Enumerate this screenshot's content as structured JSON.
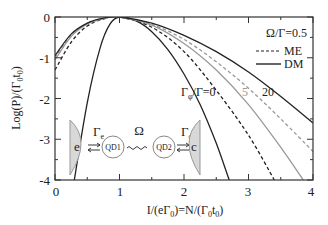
{
  "chart_data": {
    "type": "line",
    "title": "",
    "xlabel": "I/(eΓ0)=N/(Γ0t0)",
    "ylabel": "Log(P)/(Γ0t0)",
    "xlim": [
      0,
      4
    ],
    "ylim": [
      -4,
      0
    ],
    "xticks": [
      "0",
      "1",
      "2",
      "3",
      "4"
    ],
    "yticks": [
      "0",
      "-1",
      "-2",
      "-3",
      "-4"
    ],
    "grid": false,
    "legend": {
      "title": "Ω/Γ=0.5",
      "entries": [
        {
          "label": "ME",
          "style": "dashed"
        },
        {
          "label": "DM",
          "style": "solid"
        }
      ],
      "position": "upper right"
    },
    "annotations": [
      {
        "text": "Γφ/Γ=0",
        "x": 2.35,
        "y": -2.0
      },
      {
        "text": "5",
        "x": 3.08,
        "y": -2.0
      },
      {
        "text": "20",
        "x": 3.4,
        "y": -2.0
      }
    ],
    "inset_diagram": {
      "left_reservoir": "e",
      "left_rate": "Γe",
      "dot1": "QD1",
      "coupling": "Ω",
      "dot2": "QD2",
      "right_rate": "Γc",
      "right_reservoir": "c"
    },
    "series": [
      {
        "name": "DM Γφ/Γ=0",
        "style": "solid",
        "color": "#222222",
        "x": [
          0.3,
          0.5,
          0.7,
          0.85,
          1.0,
          1.25,
          1.5,
          1.75,
          2.0,
          2.25,
          2.5,
          2.7
        ],
        "y": [
          -4.0,
          -2.1,
          -0.75,
          -0.18,
          0.0,
          -0.09,
          -0.36,
          -0.8,
          -1.4,
          -2.15,
          -3.1,
          -4.0
        ]
      },
      {
        "name": "ME Γφ/Γ=0",
        "style": "dashed",
        "color": "#222222",
        "x": [
          0.0,
          0.25,
          0.5,
          0.75,
          1.0,
          1.5,
          2.0,
          2.5,
          3.0,
          3.4
        ],
        "y": [
          -1.3,
          -0.62,
          -0.22,
          -0.05,
          0.0,
          -0.25,
          -0.85,
          -1.8,
          -2.9,
          -4.0
        ]
      },
      {
        "name": "DM Γφ/Γ=5",
        "style": "solid",
        "color": "#999999",
        "x": [
          0.0,
          0.25,
          0.5,
          0.75,
          1.0,
          1.5,
          2.0,
          2.5,
          3.0,
          3.5,
          3.85
        ],
        "y": [
          -1.05,
          -0.48,
          -0.17,
          -0.04,
          0.0,
          -0.2,
          -0.65,
          -1.3,
          -2.15,
          -3.2,
          -4.0
        ]
      },
      {
        "name": "ME Γφ/Γ=5",
        "style": "dashed",
        "color": "#999999",
        "x": [
          0.0,
          0.25,
          0.5,
          0.75,
          1.0,
          1.5,
          2.0,
          2.5,
          3.0,
          3.5,
          4.0
        ],
        "y": [
          -1.0,
          -0.45,
          -0.16,
          -0.04,
          0.0,
          -0.18,
          -0.55,
          -1.1,
          -1.75,
          -2.5,
          -3.3
        ]
      },
      {
        "name": "DM Γφ/Γ=20",
        "style": "solid",
        "color": "#222222",
        "x": [
          0.0,
          0.25,
          0.5,
          0.75,
          1.0,
          1.5,
          2.0,
          2.5,
          3.0,
          3.5,
          4.0
        ],
        "y": [
          -0.95,
          -0.42,
          -0.15,
          -0.03,
          0.0,
          -0.15,
          -0.45,
          -0.85,
          -1.35,
          -1.95,
          -2.6
        ]
      }
    ]
  },
  "labels": {
    "ylabel_main": "Log(P)/(Γ",
    "xlabel_text": "I/(eΓ₀)=N/(Γ₀t₀)",
    "legend_title": "Ω/Γ=0.5",
    "legend_me": "ME",
    "legend_dm": "DM",
    "ann_0": "Γφ/Γ=0",
    "ann_5": "5",
    "ann_20": "20",
    "x0": "0",
    "x1": "1",
    "x2": "2",
    "x3": "3",
    "x4": "4",
    "y0": "0",
    "y1": "-1",
    "y2": "-2",
    "y3": "-3",
    "y4": "-4",
    "res_e": "e",
    "res_c": "c",
    "rate_e": "Γ",
    "rate_e_sub": "e",
    "rate_c": "Γ",
    "rate_c_sub": "c",
    "omega": "Ω",
    "qd1": "QD1",
    "qd2": "QD2"
  }
}
